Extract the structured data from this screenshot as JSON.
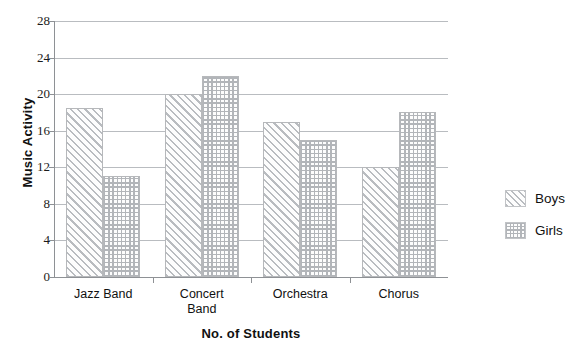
{
  "chart_data": {
    "type": "bar",
    "title": "",
    "xlabel": "No. of Students",
    "ylabel": "Music Activity",
    "categories": [
      "Jazz Band",
      "Concert\nBand",
      "Orchestra",
      "Chorus"
    ],
    "series": [
      {
        "name": "Boys",
        "values": [
          18.5,
          20,
          17,
          12
        ]
      },
      {
        "name": "Girls",
        "values": [
          11,
          22,
          15,
          18
        ]
      }
    ],
    "ylim": [
      0,
      28
    ],
    "yticks": [
      0,
      4,
      8,
      12,
      16,
      20,
      24,
      28
    ],
    "ytick_labels": [
      "0",
      "4",
      "8",
      "12",
      "16",
      "20",
      "24",
      "28"
    ],
    "grid": true,
    "legend_position": "right",
    "colors": {
      "boys_hatch": "#b9bcc0",
      "girls_hatch": "#b2b5b9",
      "gridline": "#b9bcc0",
      "axis": "#8e9195",
      "text": "#111111",
      "background": "#ffffff"
    }
  },
  "legend": {
    "items": [
      {
        "label": "Boys",
        "pattern": "diagonal-hatch-icon"
      },
      {
        "label": "Girls",
        "pattern": "crosshatch-icon"
      }
    ]
  }
}
